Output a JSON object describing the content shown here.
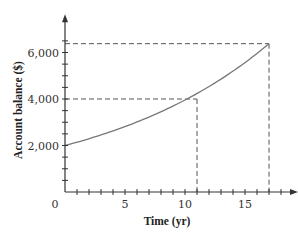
{
  "chart_data": {
    "type": "line",
    "title": "",
    "xlabel": "Time (yr)",
    "ylabel": "Account balance ($)",
    "xlim": [
      0,
      19
    ],
    "ylim": [
      0,
      7000
    ],
    "x_ticks": [
      0,
      5,
      10,
      15
    ],
    "x_tick_labels": [
      "0",
      "5",
      "10",
      "15"
    ],
    "x_minor_tick_step": 1,
    "y_ticks": [
      2000,
      4000,
      6000
    ],
    "y_tick_labels": [
      "2,000",
      "4,000",
      "6,000"
    ],
    "y_minor_tick_step": 500,
    "grid": false,
    "legend": null,
    "series": [
      {
        "name": "Account balance",
        "color": "#777777",
        "x": [
          0,
          2,
          4,
          6,
          8,
          10,
          11,
          12,
          14,
          16,
          17
        ],
        "y": [
          2000,
          2270,
          2580,
          2930,
          3330,
          3780,
          4000,
          4300,
          4880,
          5540,
          6380
        ]
      }
    ],
    "annotations": [
      {
        "type": "dashed-reference",
        "x": 11,
        "y": 4000,
        "label": "balance doubles at ~11 yr"
      },
      {
        "type": "dashed-reference",
        "x": 17,
        "y": 6380,
        "label": "balance at ~17 yr"
      }
    ],
    "axis_color": "#333333",
    "dash_color": "#555555"
  }
}
